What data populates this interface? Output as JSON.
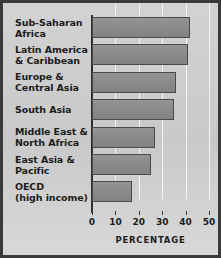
{
  "chart_data": {
    "type": "bar",
    "orientation": "horizontal",
    "title": "",
    "subtitle": "",
    "xlabel": "PERCENTAGE",
    "ylabel": "",
    "categories": [
      "Sub-Saharan Africa",
      "Latin America & Caribbean",
      "Europe & Central Asia",
      "South Asia",
      "Middle East & North Africa",
      "East Asia & Pacific",
      "OECD (high income)"
    ],
    "category_lines": [
      [
        "Sub-Saharan",
        "Africa"
      ],
      [
        "Latin America",
        "& Caribbean"
      ],
      [
        "Europe &",
        "Central Asia"
      ],
      [
        "South Asia",
        ""
      ],
      [
        "Middle East &",
        "North Africa"
      ],
      [
        "East Asia &",
        "Pacific"
      ],
      [
        "OECD",
        "(high income)"
      ]
    ],
    "values": [
      42,
      41,
      36,
      35,
      27,
      25,
      17
    ],
    "xlim": [
      0,
      50
    ],
    "xticks": [
      0,
      10,
      20,
      30,
      40,
      50
    ],
    "xtick_labels": [
      "0",
      "10",
      "20",
      "30",
      "40",
      "50"
    ],
    "grid": true,
    "gridlines_at": [
      10,
      20,
      30,
      40,
      50
    ],
    "legend": "none",
    "colors": {
      "bar_fill": "#8b8b8b",
      "bar_outline": "#4a4a4a",
      "background": "#cfcfcf",
      "gridline": "#f4f4f4",
      "axis": "#2e2e2e",
      "text": "#1c1c1c",
      "frame_border": "#3a3a3a"
    }
  }
}
